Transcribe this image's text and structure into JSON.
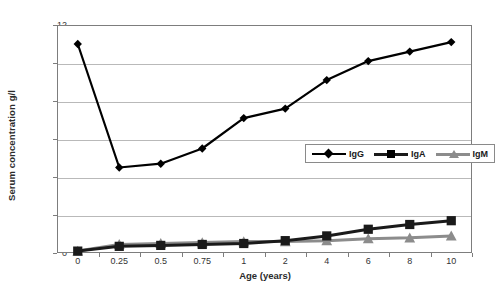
{
  "chart_data": {
    "type": "line",
    "title": "",
    "xlabel": "Age (years)",
    "ylabel": "Serum concentration g/l",
    "categories": [
      "0",
      "0.25",
      "0.5",
      "0.75",
      "1",
      "2",
      "4",
      "6",
      "8",
      "10"
    ],
    "ylim": [
      0,
      12
    ],
    "yticks": [
      0,
      2,
      4,
      6,
      8,
      10,
      12
    ],
    "grid": true,
    "legend_position": "center-right inside plot",
    "series": [
      {
        "name": "IgG",
        "marker": "diamond",
        "color": "#000000",
        "values": [
          11.0,
          4.5,
          4.7,
          5.5,
          7.1,
          7.6,
          9.1,
          10.1,
          10.6,
          11.1
        ]
      },
      {
        "name": "IgA",
        "marker": "square",
        "color": "#1a1a1a",
        "values": [
          0.1,
          0.35,
          0.4,
          0.45,
          0.5,
          0.65,
          0.9,
          1.25,
          1.5,
          1.7
        ]
      },
      {
        "name": "IgM",
        "marker": "triangle",
        "color": "#8c8c8c",
        "values": [
          0.1,
          0.45,
          0.5,
          0.55,
          0.6,
          0.6,
          0.65,
          0.75,
          0.8,
          0.9
        ]
      }
    ]
  },
  "legend": {
    "entries": [
      {
        "label": "IgG"
      },
      {
        "label": "IgA"
      },
      {
        "label": "IgM"
      }
    ]
  }
}
